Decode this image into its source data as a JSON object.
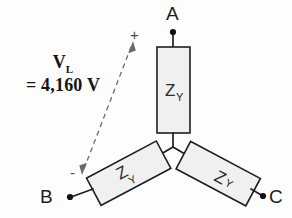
{
  "figure": {
    "type": "circuit-diagram",
    "background_color": "#fdfdfd",
    "line_color": "#1e1e1e",
    "resistor_fill": "#f0f0f0",
    "annotation_color": "#6b6b6b"
  },
  "terminals": [
    {
      "id": "a",
      "label": "A",
      "x": 172,
      "y": 18
    },
    {
      "id": "b",
      "label": "B",
      "x": 46,
      "y": 196
    },
    {
      "id": "c",
      "label": "C",
      "x": 272,
      "y": 196
    }
  ],
  "impedances": [
    {
      "id": "za",
      "symbol": "Z",
      "subscript": "Y",
      "phase": "A",
      "orientation": "vertical"
    },
    {
      "id": "zb",
      "symbol": "Z",
      "subscript": "Y",
      "phase": "B",
      "orientation": "rotated-150"
    },
    {
      "id": "zc",
      "symbol": "Z",
      "subscript": "Y",
      "phase": "C",
      "orientation": "rotated-30"
    }
  ],
  "annotation": {
    "quantity_symbol": "V",
    "quantity_subscript": "L",
    "value_line": "= 4,160 V",
    "value_number": "4,160",
    "unit": "V",
    "plus_sign": "+",
    "minus_sign": "-",
    "arrow_style": "dashed-double-headed",
    "measures": "line-to-line voltage between terminal A and terminal B"
  }
}
